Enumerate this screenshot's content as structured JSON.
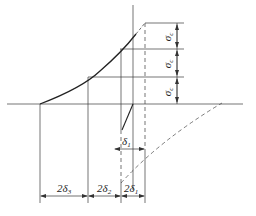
{
  "diagram": {
    "type": "stress-strain hysteresis construction",
    "colors": {
      "line": "#3a3a3a",
      "background": "#ffffff"
    },
    "labels": {
      "sigma_top": "σ",
      "sigma_mid": "σ",
      "sigma_bot": "σ",
      "sigma_sub": "c",
      "delta1_main": "δ",
      "delta1_sub": "1",
      "dim_2d3": "2δ",
      "dim_2d3_sub": "3",
      "dim_2d2": "2δ",
      "dim_2d2_sub": "2",
      "dim_2d1": "2δ",
      "dim_2d1_sub": "1"
    }
  }
}
